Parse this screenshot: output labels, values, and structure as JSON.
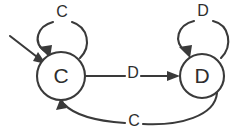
{
  "diagram": {
    "type": "finite-state-machine",
    "canvas": {
      "width": 244,
      "height": 140
    },
    "colors": {
      "background": "#ffffff",
      "stroke": "#3a3a3a",
      "label": "#2e2e2e",
      "node_fill": "#ffffff"
    },
    "states": [
      {
        "id": "C",
        "label": "C",
        "cx": 61,
        "cy": 76,
        "r": 24,
        "initial": true
      },
      {
        "id": "D",
        "label": "D",
        "cx": 202,
        "cy": 76,
        "r": 22
      }
    ],
    "transitions": [
      {
        "id": "c-self",
        "from": "C",
        "to": "C",
        "label": "C",
        "label_x": 62,
        "label_y": 13,
        "kind": "self-loop"
      },
      {
        "id": "d-self",
        "from": "D",
        "to": "D",
        "label": "D",
        "label_x": 203,
        "label_y": 12,
        "kind": "self-loop"
      },
      {
        "id": "c-to-d",
        "from": "C",
        "to": "D",
        "label": "D",
        "label_x": 133,
        "label_y": 74,
        "kind": "straight"
      },
      {
        "id": "d-to-c",
        "from": "D",
        "to": "C",
        "label": "C",
        "label_x": 134,
        "label_y": 122,
        "kind": "curve-below"
      }
    ],
    "start_marker": {
      "id": "start-arrow",
      "label": "",
      "from_x": 10,
      "from_y": 36,
      "to_x": 44,
      "to_y": 62
    }
  }
}
